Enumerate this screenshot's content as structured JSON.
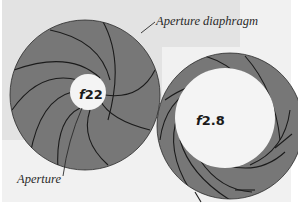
{
  "diagram": {
    "colors": {
      "outer_panel": "#f1f1f1",
      "inner_panel": "#e3e3e3",
      "diaphragm_fill": "#777777",
      "blade_edge": "#1b1b1b",
      "aperture_opening": "#f4f4f4"
    },
    "labels": {
      "aperture_diaphragm": "Aperture diaphragm",
      "aperture": "Aperture"
    },
    "diaphragms": [
      {
        "name": "small-aperture",
        "f_prefix": "f",
        "f_number": "22",
        "blade_count": 9
      },
      {
        "name": "large-aperture",
        "f_prefix": "f",
        "f_number": "2.8",
        "blade_count": 9
      }
    ]
  }
}
